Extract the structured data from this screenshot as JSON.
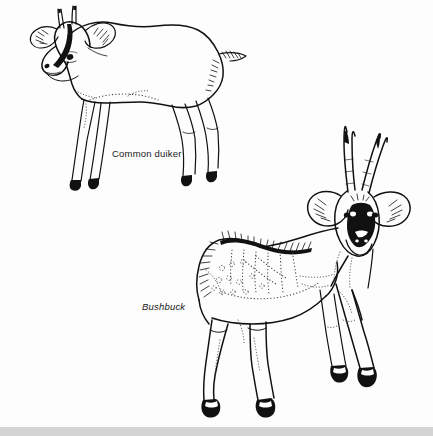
{
  "page": {
    "background_color": "#fdfdfd",
    "ink_color": "#111111",
    "bottom_band_color": "#d4d4d4",
    "width": 433,
    "height": 436,
    "style": "black-and-white pen-and-ink natural history illustration"
  },
  "figures": [
    {
      "id": "common-duiker",
      "label": "Common duiker",
      "label_style": "upright",
      "position": "upper-left",
      "pose": "standing in profile facing left, head lowered, back arched",
      "features": [
        "two short straight spike horns",
        "large rounded ears with inner hair hatching",
        "dark facial blaze stripe from forehead to muzzle",
        "dark eye",
        "arched back",
        "short tufted tail with hatched fur strokes",
        "slender legs with solid black hooves"
      ]
    },
    {
      "id": "bushbuck",
      "label": "Bushbuck",
      "label_style": "italic",
      "position": "lower-right",
      "pose": "standing in three-quarter view, head turned toward viewer",
      "features": [
        "long spiralled horns rising in a V",
        "large ears with inner hair hatching",
        "dark face mask with white eye and cheek spots",
        "dark hatched dorsal crest along the spine",
        "dotted vertical stripes across the flank",
        "scattered dots on shoulder and haunch",
        "white throat patch",
        "solid black hooves with white band above"
      ]
    }
  ],
  "labels": {
    "duiker": "Common duiker",
    "bushbuck": "Bushbuck"
  }
}
